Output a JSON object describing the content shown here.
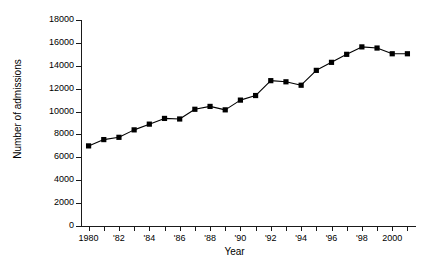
{
  "chart_data": {
    "type": "line",
    "title": "",
    "subtitle": "",
    "xlabel": "Year",
    "ylabel": "Number of admissions",
    "xlim": [
      1979.5,
      2001.5
    ],
    "ylim": [
      0,
      18000
    ],
    "grid": false,
    "legend": null,
    "marker": "square",
    "line_color": "#000000",
    "marker_color": "#000000",
    "ytick_values": [
      0,
      2000,
      4000,
      6000,
      8000,
      10000,
      12000,
      14000,
      16000,
      18000
    ],
    "ytick_labels": [
      "0",
      "2000",
      "4000",
      "6000",
      "8000",
      "10000",
      "12000",
      "14000",
      "16000",
      "18000"
    ],
    "xtick_values": [
      1980,
      1981,
      1982,
      1983,
      1984,
      1985,
      1986,
      1987,
      1988,
      1989,
      1990,
      1991,
      1992,
      1993,
      1994,
      1995,
      1996,
      1997,
      1998,
      1999,
      2000,
      2001
    ],
    "xtick_labels": [
      "1980",
      "",
      "'82",
      "",
      "'84",
      "",
      "'86",
      "",
      "'88",
      "",
      "'90",
      "",
      "'92",
      "",
      "'94",
      "",
      "'96",
      "",
      "'98",
      "",
      "2000",
      ""
    ],
    "x": [
      1980,
      1981,
      1982,
      1983,
      1984,
      1985,
      1986,
      1987,
      1988,
      1989,
      1990,
      1991,
      1992,
      1993,
      1994,
      1995,
      1996,
      1997,
      1998,
      1999,
      2000,
      2001
    ],
    "values": [
      7000,
      7550,
      7750,
      8400,
      8900,
      9400,
      9350,
      10200,
      10450,
      10150,
      11000,
      11400,
      12700,
      12600,
      12300,
      13600,
      14300,
      15000,
      15650,
      15550,
      15050,
      15050
    ],
    "categories": [
      "1980",
      "1981",
      "1982",
      "1983",
      "1984",
      "1985",
      "1986",
      "1987",
      "1988",
      "1989",
      "1990",
      "1991",
      "1992",
      "1993",
      "1994",
      "1995",
      "1996",
      "1997",
      "1998",
      "1999",
      "2000",
      "2001"
    ],
    "series": [
      {
        "name": "Number of admissions",
        "values": [
          7000,
          7550,
          7750,
          8400,
          8900,
          9400,
          9350,
          10200,
          10450,
          10150,
          11000,
          11400,
          12700,
          12600,
          12300,
          13600,
          14300,
          15000,
          15650,
          15550,
          15050,
          15050
        ]
      }
    ]
  }
}
